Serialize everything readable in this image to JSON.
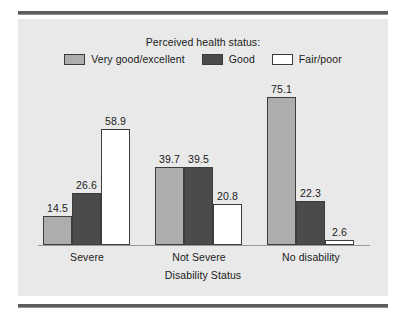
{
  "legend": {
    "title": "Perceived health status:",
    "items": [
      {
        "label": "Very good/excellent",
        "color": "#adadad",
        "icon": "legend-swatch-icon"
      },
      {
        "label": "Good",
        "color": "#4b4b4b",
        "icon": "legend-swatch-icon"
      },
      {
        "label": "Fair/poor",
        "color": "#ffffff",
        "icon": "legend-swatch-icon"
      }
    ]
  },
  "chart_data": {
    "type": "bar",
    "title": "Perceived health status:",
    "xlabel": "Disability Status",
    "ylabel": "",
    "categories": [
      "Severe",
      "Not Severe",
      "No disability"
    ],
    "series": [
      {
        "name": "Very good/excellent",
        "color": "#adadad",
        "values": [
          14.5,
          39.7,
          75.1
        ]
      },
      {
        "name": "Good",
        "color": "#4b4b4b",
        "values": [
          26.6,
          39.5,
          22.3
        ]
      },
      {
        "name": "Fair/poor",
        "color": "#ffffff",
        "values": [
          58.9,
          20.8,
          2.6
        ]
      }
    ],
    "ylim": [
      0,
      80
    ],
    "grid": false,
    "legend_position": "top",
    "data_labels": true,
    "panel_color": "#e9e9e9",
    "bar_border_color": "#3d3d3d"
  },
  "labels": {
    "v_s_1": "14.5",
    "v_s_2": "26.6",
    "v_s_3": "58.9",
    "v_n_1": "39.7",
    "v_n_2": "39.5",
    "v_n_3": "20.8",
    "v_d_1": "75.1",
    "v_d_2": "22.3",
    "v_d_3": "2.6",
    "cat_1": "Severe",
    "cat_2": "Not Severe",
    "cat_3": "No disability",
    "axis_title": "Disability Status"
  }
}
